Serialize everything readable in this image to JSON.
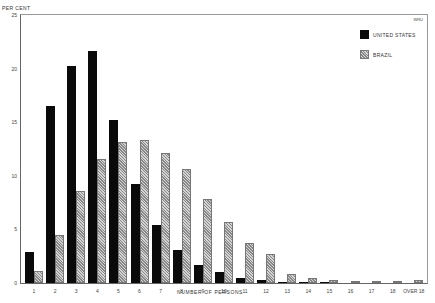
{
  "chart_data": {
    "type": "bar",
    "title": "",
    "ylabel": "PER CENT",
    "xlabel": "NUMBER OF PERSONS",
    "ylim": [
      0,
      25
    ],
    "yticks": [
      "0",
      "5",
      "10",
      "15",
      "20",
      "25"
    ],
    "grid": false,
    "legend_position": "upper right",
    "corner_mark": "WRU",
    "categories": [
      "1",
      "2",
      "3",
      "4",
      "5",
      "6",
      "7",
      "8",
      "9",
      "10",
      "11",
      "12",
      "13",
      "14",
      "15",
      "16",
      "17",
      "18",
      "OVER 18"
    ],
    "series": [
      {
        "name": "UNITED STATES",
        "color": "#0a0a0a",
        "pattern": "solid",
        "values": [
          2.9,
          16.5,
          20.2,
          21.6,
          15.2,
          9.2,
          5.4,
          3.1,
          1.7,
          1.0,
          0.5,
          0.3,
          0.1,
          0.1,
          0.05,
          0.0,
          0.0,
          0.0,
          0.0
        ]
      },
      {
        "name": "BRAZIL",
        "color": "#bbbbbb",
        "pattern": "crosshatch",
        "values": [
          1.1,
          4.5,
          8.6,
          11.6,
          13.2,
          13.3,
          12.1,
          10.6,
          7.8,
          5.7,
          3.7,
          2.7,
          0.8,
          0.5,
          0.3,
          0.2,
          0.1,
          0.05,
          0.3
        ]
      }
    ]
  },
  "labels": {
    "ytitle": "PER CENT",
    "xtitle": "NUMBER OF PERSONS",
    "corner": "WRU",
    "legend_us": "UNITED STATES",
    "legend_brazil": "BRAZIL"
  }
}
